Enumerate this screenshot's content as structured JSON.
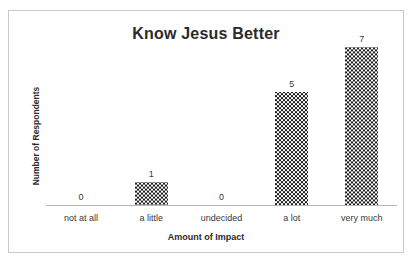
{
  "chart_data": {
    "type": "bar",
    "title": "Know Jesus Better",
    "xlabel": "Amount of Impact",
    "ylabel": "Number of Respondents",
    "categories": [
      "not at all",
      "a little",
      "undecided",
      "a lot",
      "very much"
    ],
    "values": [
      0,
      1,
      0,
      5,
      7
    ],
    "value_labels": [
      "0",
      "1",
      "0",
      "5",
      "7"
    ],
    "ylim": [
      0,
      7.6
    ],
    "grid": false,
    "legend": false,
    "legend_position": "none",
    "axis_line_color": "#b7b7b7",
    "bar_fill": "checkerboard-black-white",
    "bar_color": "#1c1c1c",
    "frame_border_color": "#c9c9c9",
    "background": "#ffffff",
    "text_color": "#3a3a3a"
  }
}
